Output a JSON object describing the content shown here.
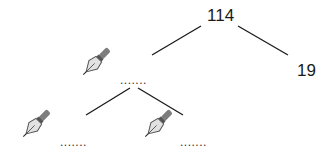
{
  "diagram": {
    "type": "factor-tree",
    "root": {
      "value": "114"
    },
    "level1": {
      "left": {
        "value": "",
        "blank": ".......",
        "icon": "pen-nib-icon"
      },
      "right": {
        "value": "19"
      }
    },
    "level2": {
      "left": {
        "value": "",
        "blank": ".......",
        "icon": "pen-nib-icon"
      },
      "right": {
        "value": "",
        "blank": ".......",
        "icon": "pen-nib-icon"
      }
    },
    "colors": {
      "line": "#1a1a1a",
      "text": "#1a1a1a",
      "pen_body": "#8a8a8a",
      "pen_nib": "#dcdcdc"
    }
  }
}
